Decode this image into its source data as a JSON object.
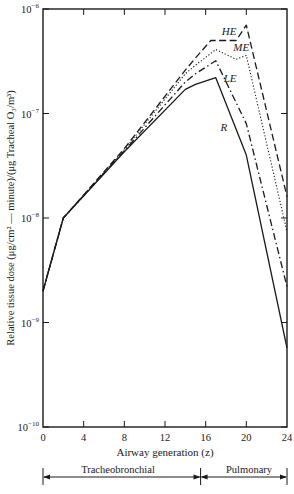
{
  "chart_data": {
    "type": "line",
    "title": "",
    "xlabel": "Airway generation (z)",
    "ylabel": "Relative tissue dose (μg/cm² — minute)/(μg Tracheal O₃/m³)",
    "yscale": "log",
    "xlim": [
      0,
      24
    ],
    "ylim": [
      1e-10,
      1e-06
    ],
    "grid": false,
    "x_ticks": [
      0,
      4,
      8,
      12,
      16,
      20,
      24
    ],
    "x_tick_labels": [
      "0",
      "4",
      "8",
      "12",
      "16",
      "20",
      "24"
    ],
    "y_ticks": [
      1e-10,
      1e-09,
      1e-08,
      1e-07,
      1e-06
    ],
    "y_tick_labels": [
      {
        "base": "10",
        "exp": "−10"
      },
      {
        "base": "10",
        "exp": "−9"
      },
      {
        "base": "10",
        "exp": "−8"
      },
      {
        "base": "10",
        "exp": "−7"
      },
      {
        "base": "10",
        "exp": "−6"
      }
    ],
    "series": [
      {
        "name": "HE",
        "style": "dashed",
        "x": [
          0,
          2,
          8,
          14,
          15,
          16.5,
          19,
          20,
          24
        ],
        "values": [
          2e-09,
          1e-08,
          4.6e-08,
          2.6e-07,
          3.4e-07,
          5e-07,
          5e-07,
          7e-07,
          1.6e-08
        ],
        "label_pos": [
          18.3,
          5.6e-07
        ]
      },
      {
        "name": "ME",
        "style": "dotted",
        "x": [
          0,
          2,
          8,
          14,
          15,
          17,
          19,
          20,
          24
        ],
        "values": [
          2e-09,
          1e-08,
          4.5e-08,
          2.4e-07,
          2.9e-07,
          4.1e-07,
          3.3e-07,
          3.6e-07,
          7.4e-09
        ],
        "label_pos": [
          19.5,
          4e-07
        ]
      },
      {
        "name": "LE",
        "style": "dash-dot",
        "x": [
          0,
          2,
          8,
          14,
          15,
          17,
          20,
          24
        ],
        "values": [
          2e-09,
          1e-08,
          4.4e-08,
          2e-07,
          2.4e-07,
          3.2e-07,
          8e-08,
          2.2e-09
        ],
        "label_pos": [
          18.4,
          2e-07
        ]
      },
      {
        "name": "R",
        "style": "solid",
        "x": [
          0,
          2,
          8,
          14,
          15,
          17,
          20,
          24
        ],
        "values": [
          2e-09,
          1e-08,
          4.3e-08,
          1.7e-07,
          1.9e-07,
          2.2e-07,
          4e-08,
          5.7e-10
        ],
        "label_pos": [
          17.8,
          6.8e-08
        ]
      }
    ],
    "legend": "inline labels",
    "annotations": {
      "regions": [
        {
          "label": "Tracheobronchial",
          "from": 0,
          "to": 15.5
        },
        {
          "label": "Pulmonary",
          "from": 15.5,
          "to": 24
        }
      ]
    }
  },
  "axis": {
    "ylabel_text": "Relative tissue dose (μg/cm² — minute)/(μg Tracheal O₃/m³)",
    "xlabel_text": "Airway generation (z)"
  },
  "regions": {
    "tracheobronchial": "Tracheobronchial",
    "pulmonary": "Pulmonary"
  }
}
